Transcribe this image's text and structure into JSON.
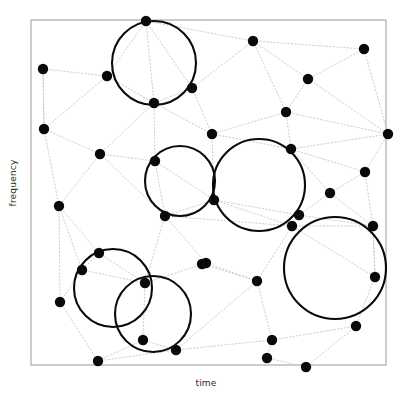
{
  "figure": {
    "title": "",
    "xlabel": "time",
    "ylabel": "frequency",
    "frame_color": "#9a9a9a",
    "point_color": "#0a0a0a",
    "edge_color": "#c8c8c8",
    "circle_color": "#0a0a0a",
    "background": "#ffffff"
  },
  "chart_data": {
    "type": "scatter",
    "title": "",
    "xlabel": "time",
    "ylabel": "frequency",
    "xlim": [
      0,
      412
    ],
    "ylim": [
      0,
      403
    ],
    "grid": false,
    "legend": null,
    "axis_ticks": {
      "x": [],
      "y": []
    },
    "frame": {
      "x": 31,
      "y": 20,
      "width": 355,
      "height": 345
    },
    "point_radius": 5.2,
    "points": [
      {
        "id": 1,
        "x": 146,
        "y": 21
      },
      {
        "id": 2,
        "x": 43,
        "y": 69
      },
      {
        "id": 3,
        "x": 107,
        "y": 76
      },
      {
        "id": 4,
        "x": 253,
        "y": 41
      },
      {
        "id": 5,
        "x": 364,
        "y": 49
      },
      {
        "id": 6,
        "x": 154,
        "y": 103
      },
      {
        "id": 7,
        "x": 192,
        "y": 88
      },
      {
        "id": 8,
        "x": 308,
        "y": 79
      },
      {
        "id": 9,
        "x": 44,
        "y": 129
      },
      {
        "id": 10,
        "x": 286,
        "y": 112
      },
      {
        "id": 11,
        "x": 212,
        "y": 134
      },
      {
        "id": 12,
        "x": 388,
        "y": 134
      },
      {
        "id": 13,
        "x": 100,
        "y": 154
      },
      {
        "id": 14,
        "x": 155,
        "y": 161
      },
      {
        "id": 15,
        "x": 291,
        "y": 149
      },
      {
        "id": 16,
        "x": 365,
        "y": 172
      },
      {
        "id": 17,
        "x": 59,
        "y": 206
      },
      {
        "id": 18,
        "x": 330,
        "y": 193
      },
      {
        "id": 19,
        "x": 165,
        "y": 216
      },
      {
        "id": 20,
        "x": 214,
        "y": 200
      },
      {
        "id": 21,
        "x": 299,
        "y": 215
      },
      {
        "id": 22,
        "x": 292,
        "y": 226
      },
      {
        "id": 23,
        "x": 373,
        "y": 226
      },
      {
        "id": 24,
        "x": 99,
        "y": 253
      },
      {
        "id": 25,
        "x": 206,
        "y": 263
      },
      {
        "id": 26,
        "x": 82,
        "y": 270
      },
      {
        "id": 27,
        "x": 145,
        "y": 283
      },
      {
        "id": 28,
        "x": 60,
        "y": 302
      },
      {
        "id": 29,
        "x": 202,
        "y": 264
      },
      {
        "id": 30,
        "x": 257,
        "y": 281
      },
      {
        "id": 31,
        "x": 375,
        "y": 277
      },
      {
        "id": 32,
        "x": 143,
        "y": 340
      },
      {
        "id": 33,
        "x": 176,
        "y": 350
      },
      {
        "id": 34,
        "x": 356,
        "y": 326
      },
      {
        "id": 35,
        "x": 272,
        "y": 340
      },
      {
        "id": 36,
        "x": 98,
        "y": 361
      },
      {
        "id": 37,
        "x": 267,
        "y": 358
      },
      {
        "id": 38,
        "x": 306,
        "y": 367
      }
    ],
    "edges": [
      [
        2,
        3
      ],
      [
        2,
        9
      ],
      [
        3,
        1
      ],
      [
        3,
        6
      ],
      [
        3,
        9
      ],
      [
        1,
        6
      ],
      [
        1,
        7
      ],
      [
        1,
        4
      ],
      [
        4,
        7
      ],
      [
        4,
        8
      ],
      [
        4,
        10
      ],
      [
        4,
        5
      ],
      [
        5,
        8
      ],
      [
        5,
        12
      ],
      [
        8,
        10
      ],
      [
        8,
        12
      ],
      [
        10,
        11
      ],
      [
        10,
        12
      ],
      [
        10,
        15
      ],
      [
        11,
        7
      ],
      [
        11,
        6
      ],
      [
        11,
        15
      ],
      [
        12,
        15
      ],
      [
        12,
        16
      ],
      [
        15,
        16
      ],
      [
        15,
        18
      ],
      [
        6,
        7
      ],
      [
        6,
        13
      ],
      [
        6,
        14
      ],
      [
        9,
        13
      ],
      [
        9,
        17
      ],
      [
        13,
        14
      ],
      [
        13,
        17
      ],
      [
        14,
        19
      ],
      [
        14,
        20
      ],
      [
        11,
        20
      ],
      [
        20,
        21
      ],
      [
        20,
        19
      ],
      [
        18,
        16
      ],
      [
        18,
        21
      ],
      [
        18,
        23
      ],
      [
        16,
        23
      ],
      [
        21,
        22
      ],
      [
        21,
        23
      ],
      [
        22,
        23
      ],
      [
        22,
        31
      ],
      [
        23,
        31
      ],
      [
        17,
        24
      ],
      [
        17,
        26
      ],
      [
        17,
        28
      ],
      [
        24,
        26
      ],
      [
        24,
        27
      ],
      [
        19,
        25
      ],
      [
        19,
        27
      ],
      [
        25,
        27
      ],
      [
        25,
        30
      ],
      [
        27,
        32
      ],
      [
        28,
        26
      ],
      [
        28,
        36
      ],
      [
        32,
        33
      ],
      [
        32,
        36
      ],
      [
        33,
        30
      ],
      [
        33,
        35
      ],
      [
        30,
        35
      ],
      [
        35,
        37
      ],
      [
        35,
        34
      ],
      [
        31,
        34
      ],
      [
        34,
        38
      ],
      [
        37,
        38
      ],
      [
        36,
        33
      ],
      [
        22,
        30
      ],
      [
        31,
        23
      ],
      [
        19,
        22
      ],
      [
        20,
        22
      ],
      [
        13,
        19
      ],
      [
        9,
        2
      ],
      [
        26,
        27
      ],
      [
        29,
        30
      ]
    ],
    "circles": [
      {
        "id": "c1",
        "cx": 154,
        "cy": 63,
        "r": 42,
        "through": [
          1,
          6,
          7
        ]
      },
      {
        "id": "c2",
        "cx": 180,
        "cy": 181,
        "r": 35,
        "through": [
          14,
          19,
          20
        ]
      },
      {
        "id": "c3",
        "cx": 259,
        "cy": 185,
        "r": 46,
        "through": [
          15,
          20,
          21,
          22
        ]
      },
      {
        "id": "c4",
        "cx": 335,
        "cy": 268,
        "r": 51,
        "through": [
          22,
          23,
          31,
          34
        ]
      },
      {
        "id": "c5",
        "cx": 113,
        "cy": 288,
        "r": 39,
        "through": [
          24,
          26,
          27
        ]
      },
      {
        "id": "c6",
        "cx": 153,
        "cy": 314,
        "r": 38,
        "through": [
          27,
          32,
          33
        ]
      }
    ]
  }
}
